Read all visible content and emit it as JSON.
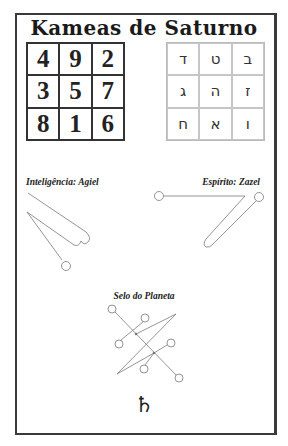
{
  "title": "Kameas de Saturno",
  "number_square": [
    [
      "4",
      "9",
      "2"
    ],
    [
      "3",
      "5",
      "7"
    ],
    [
      "8",
      "1",
      "6"
    ]
  ],
  "hebrew_square": [
    [
      "ד",
      "ט",
      "ב"
    ],
    [
      "ג",
      "ה",
      "ז"
    ],
    [
      "ח",
      "א",
      "ו"
    ]
  ],
  "labels": {
    "intelligence": "Inteligência: Agiel",
    "spirit": "Espírito: Zazel",
    "planet_seal": "Selo do Planeta"
  },
  "planet_symbol": "♄",
  "colors": {
    "border": "#3a3a3a",
    "line": "#888888",
    "text": "#222222"
  }
}
